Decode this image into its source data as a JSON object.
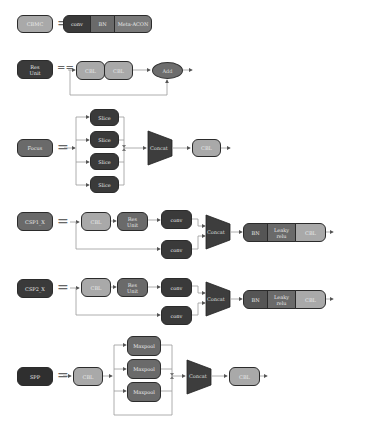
{
  "diagram": {
    "rows": [
      {
        "name": "CBMC",
        "equals": "=",
        "blocks": [
          "conv",
          "BN",
          "Meta-ACON"
        ]
      },
      {
        "name": "Res\nUnit",
        "equals": "==",
        "blocks": [
          "CBL",
          "CBL"
        ],
        "merge": "Add"
      },
      {
        "name": "Focus",
        "equals": "=",
        "branches": [
          "Slice",
          "Slice",
          "Slice",
          "Slice"
        ],
        "concat": "Concat",
        "output": "CBL"
      },
      {
        "name": "CSP1_X",
        "equals": "=",
        "main_path": [
          "CBL",
          "Res\nUnit",
          "conv"
        ],
        "bypass": "conv",
        "concat": "Concat",
        "tail": [
          "BN",
          "Leaky\nrelu",
          "CBL"
        ]
      },
      {
        "name": "CSP2_X",
        "equals": "=",
        "main_path": [
          "CBL",
          "Res\nUnit",
          "conv"
        ],
        "bypass": "conv",
        "concat": "Concat",
        "tail": [
          "BN",
          "Leaky\nrelu",
          "CBL"
        ]
      },
      {
        "name": "SPP",
        "equals": "=",
        "input": "CBL",
        "branches": [
          "Maxpool",
          "Maxpool",
          "Maxpool"
        ],
        "concat": "Concat",
        "output": "CBL"
      }
    ]
  },
  "colors": {
    "dark": "#3a3a3a",
    "mid": "#6a6a6a",
    "light": "#a9a9a9",
    "line": "#8a8a8a"
  }
}
